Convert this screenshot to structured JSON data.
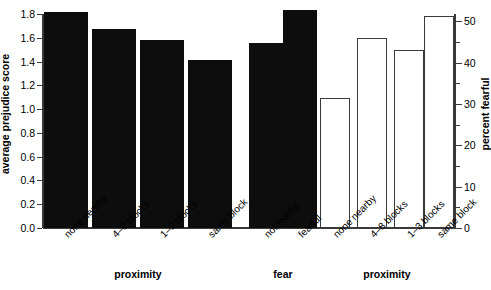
{
  "chart_data": {
    "type": "bar",
    "title": "",
    "subtitle": "",
    "axes": {
      "left": {
        "label": "average prejudice score",
        "ticks": [
          "0.0",
          "0.2",
          "0.4",
          "0.6",
          "0.8",
          "1.0",
          "1.2",
          "1.4",
          "1.6",
          "1.8"
        ],
        "tick_values": [
          0.0,
          0.2,
          0.4,
          0.6,
          0.8,
          1.0,
          1.2,
          1.4,
          1.6,
          1.8
        ],
        "range": [
          0.0,
          1.8
        ]
      },
      "right": {
        "label": "percent fearful",
        "ticks": [
          "0",
          "10",
          "20",
          "30",
          "40",
          "50"
        ],
        "tick_values": [
          0,
          10,
          20,
          30,
          40,
          50
        ],
        "minor_tick_values": [
          5,
          15,
          25,
          35,
          45
        ],
        "range": [
          0,
          51.8
        ]
      }
    },
    "grid": false,
    "legend": null,
    "groups": [
      {
        "name": "proximity",
        "group_label": "proximity",
        "axis": "left",
        "style": "filled",
        "categories": [
          "none nearby",
          "4–8 blocks",
          "1–3 blocks",
          "same block"
        ],
        "values": [
          1.82,
          1.67,
          1.58,
          1.41
        ]
      },
      {
        "name": "fear",
        "group_label": "fear",
        "axis": "left",
        "style": "filled",
        "categories": [
          "not fearful",
          "fearful"
        ],
        "values": [
          1.56,
          1.83
        ]
      },
      {
        "name": "proximity_percent_fearful",
        "group_label": "proximity",
        "axis": "right",
        "style": "outlined",
        "categories": [
          "none nearby",
          "4–8 blocks",
          "1–3 blocks",
          "same block"
        ],
        "values": [
          31.5,
          46.0,
          43.0,
          51.3
        ]
      }
    ],
    "colors": {
      "filled_bar": "#0d0d0d",
      "outlined_bar_stroke": "#3a3a3a",
      "outlined_bar_fill": "#ffffff",
      "axis": "#3a3a3a",
      "text": "#000000",
      "background": "#ffffff"
    }
  }
}
